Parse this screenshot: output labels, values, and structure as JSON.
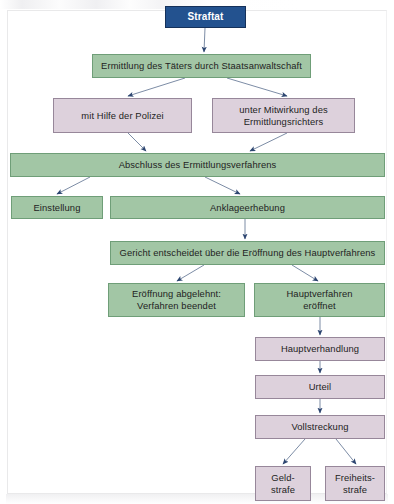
{
  "diagram": {
    "colors": {
      "green_fill": "#a2c6a5",
      "green_border": "#6f9e78",
      "mauve_fill": "#ddd1dc",
      "mauve_border": "#97879a",
      "blue_fill": "#23528f",
      "blue_border": "#15315a",
      "arrow": "#4a5f80",
      "text": "#232323",
      "page_background": "#ffffff"
    },
    "nodes": [
      {
        "id": "straftat",
        "label": "Straftat",
        "style": "blue",
        "x": 165,
        "y": 6,
        "w": 81,
        "h": 22
      },
      {
        "id": "ermittlung",
        "label": "Ermittlung des Täters durch Staatsanwaltschaft",
        "style": "green",
        "x": 92,
        "y": 54,
        "w": 219,
        "h": 24
      },
      {
        "id": "polizei",
        "label": "mit Hilfe der Polizei",
        "style": "mauve",
        "x": 53,
        "y": 98,
        "w": 139,
        "h": 35
      },
      {
        "id": "ermittlungsrichter",
        "label": "unter Mitwirkung des Ermittlungsrichters",
        "style": "mauve",
        "x": 212,
        "y": 98,
        "w": 143,
        "h": 35
      },
      {
        "id": "abschluss",
        "label": "Abschluss des Ermittlungsverfahrens",
        "style": "green",
        "x": 10,
        "y": 153,
        "w": 375,
        "h": 24
      },
      {
        "id": "einstellung",
        "label": "Einstellung",
        "style": "green",
        "x": 11,
        "y": 196,
        "w": 92,
        "h": 23
      },
      {
        "id": "anklageerhebung",
        "label": "Anklageerhebung",
        "style": "green",
        "x": 110,
        "y": 196,
        "w": 275,
        "h": 23
      },
      {
        "id": "gericht",
        "label": "Gericht entscheidet über die Eröffnung des Hauptverfahrens",
        "style": "green",
        "x": 110,
        "y": 241,
        "w": 275,
        "h": 24
      },
      {
        "id": "abgelehnt",
        "label": "Eröffnung abgelehnt: Verfahren beendet",
        "style": "green",
        "x": 108,
        "y": 283,
        "w": 137,
        "h": 34
      },
      {
        "id": "eroeffnet",
        "label": "Hauptverfahren eröffnet",
        "style": "green",
        "x": 254,
        "y": 283,
        "w": 131,
        "h": 34
      },
      {
        "id": "hauptverhandlung",
        "label": "Hauptverhandlung",
        "style": "mauve",
        "x": 255,
        "y": 337,
        "w": 130,
        "h": 24
      },
      {
        "id": "urteil",
        "label": "Urteil",
        "style": "mauve",
        "x": 255,
        "y": 375,
        "w": 130,
        "h": 24
      },
      {
        "id": "vollstreckung",
        "label": "Vollstreckung",
        "style": "mauve",
        "x": 255,
        "y": 415,
        "w": 130,
        "h": 24
      },
      {
        "id": "geldstrafe",
        "label": "Geld- strafe",
        "style": "mauve",
        "x": 255,
        "y": 466,
        "w": 56,
        "h": 35
      },
      {
        "id": "freiheitsstrafe",
        "label": "Freiheits- strafe",
        "style": "mauve",
        "x": 325,
        "y": 466,
        "w": 60,
        "h": 35
      }
    ],
    "node_lines": {
      "straftat": [
        "Straftat"
      ],
      "ermittlung": [
        "Ermittlung des Täters durch Staatsanwaltschaft"
      ],
      "polizei": [
        "mit Hilfe der Polizei"
      ],
      "ermittlungsrichter": [
        "unter Mitwirkung des",
        "Ermittlungsrichters"
      ],
      "abschluss": [
        "Abschluss des Ermittlungsverfahrens"
      ],
      "einstellung": [
        "Einstellung"
      ],
      "anklageerhebung": [
        "Anklageerhebung"
      ],
      "gericht": [
        "Gericht entscheidet über die Eröffnung des Hauptverfahrens"
      ],
      "abgelehnt": [
        "Eröffnung abgelehnt:",
        "Verfahren beendet"
      ],
      "eroeffnet": [
        "Hauptverfahren",
        "eröffnet"
      ],
      "hauptverhandlung": [
        "Hauptverhandlung"
      ],
      "urteil": [
        "Urteil"
      ],
      "vollstreckung": [
        "Vollstreckung"
      ],
      "geldstrafe": [
        "Geld-",
        "strafe"
      ],
      "freiheitsstrafe": [
        "Freiheits-",
        "strafe"
      ]
    },
    "edges": [
      {
        "from": "straftat",
        "to": "ermittlung",
        "x1": 205,
        "y1": 28,
        "x2": 204,
        "y2": 52
      },
      {
        "from": "ermittlung",
        "to": "polizei",
        "x1": 185,
        "y1": 78,
        "x2": 128,
        "y2": 96
      },
      {
        "from": "ermittlung",
        "to": "ermittlungsrichter",
        "x1": 227,
        "y1": 78,
        "x2": 287,
        "y2": 96
      },
      {
        "from": "polizei",
        "to": "abschluss",
        "x1": 128,
        "y1": 133,
        "x2": 146,
        "y2": 151
      },
      {
        "from": "ermittlungsrichter",
        "to": "abschluss",
        "x1": 287,
        "y1": 133,
        "x2": 250,
        "y2": 151
      },
      {
        "from": "abschluss",
        "to": "einstellung",
        "x1": 90,
        "y1": 177,
        "x2": 57,
        "y2": 194
      },
      {
        "from": "abschluss",
        "to": "anklageerhebung",
        "x1": 205,
        "y1": 177,
        "x2": 240,
        "y2": 194
      },
      {
        "from": "anklageerhebung",
        "to": "gericht",
        "x1": 245,
        "y1": 219,
        "x2": 245,
        "y2": 239
      },
      {
        "from": "gericht",
        "to": "abgelehnt",
        "x1": 204,
        "y1": 265,
        "x2": 177,
        "y2": 281
      },
      {
        "from": "gericht",
        "to": "eroeffnet",
        "x1": 292,
        "y1": 265,
        "x2": 318,
        "y2": 281
      },
      {
        "from": "eroeffnet",
        "to": "hauptverhandlung",
        "x1": 320,
        "y1": 317,
        "x2": 320,
        "y2": 335
      },
      {
        "from": "hauptverhandlung",
        "to": "urteil",
        "x1": 320,
        "y1": 361,
        "x2": 320,
        "y2": 373
      },
      {
        "from": "urteil",
        "to": "vollstreckung",
        "x1": 320,
        "y1": 399,
        "x2": 320,
        "y2": 413
      },
      {
        "from": "vollstreckung",
        "to": "geldstrafe",
        "x1": 305,
        "y1": 439,
        "x2": 283,
        "y2": 464
      },
      {
        "from": "vollstreckung",
        "to": "freiheitsstrafe",
        "x1": 336,
        "y1": 439,
        "x2": 356,
        "y2": 464
      }
    ]
  }
}
